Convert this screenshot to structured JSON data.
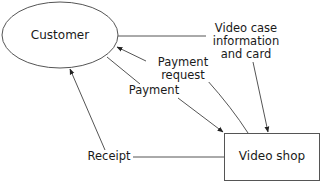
{
  "diagram": {
    "type": "context-diagram",
    "nodes": {
      "customer": {
        "label": "Customer",
        "shape": "ellipse"
      },
      "video_shop": {
        "label": "Video shop",
        "shape": "rectangle"
      }
    },
    "flows": {
      "video_case": {
        "label": "Video case information and card",
        "label_lines": [
          "Video case",
          "information",
          "and card"
        ],
        "from": "Customer",
        "to": "Video shop"
      },
      "payment_request": {
        "label": "Payment request",
        "label_lines": [
          "Payment",
          "request"
        ],
        "from": "Video shop",
        "to": "Customer"
      },
      "payment": {
        "label": "Payment",
        "from": "Customer",
        "to": "Video shop"
      },
      "receipt": {
        "label": "Receipt",
        "from": "Video shop",
        "to": "Customer"
      }
    },
    "colors": {
      "stroke": "#555555",
      "text": "#1a1a1a",
      "background": "#ffffff"
    }
  }
}
